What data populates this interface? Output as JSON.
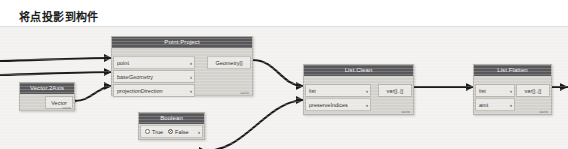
{
  "page": {
    "title": "将点投影到构件"
  },
  "canvas": {
    "background": "#f2f1ef",
    "node_body_color": "#d4d2cd",
    "node_header_color": "#58585a",
    "port_color": "#e9e8e5",
    "wire_color": "#1b1b1b"
  },
  "nodes": [
    {
      "id": "point-project",
      "title": "Point.Project",
      "inputs": [
        {
          "label": "point",
          "chevron": "›"
        },
        {
          "label": "baseGeometry",
          "chevron": "›"
        },
        {
          "label": "projectionDirection",
          "chevron": "›"
        }
      ],
      "outputs": [
        {
          "label": "Geometry[]"
        }
      ],
      "footer": "auto"
    },
    {
      "id": "vector-2axis",
      "title": "Vector.2Axis",
      "inputs": [],
      "outputs": [
        {
          "label": "Vector"
        }
      ],
      "footer": "auto"
    },
    {
      "id": "boolean",
      "title": "Boolean",
      "options": [
        {
          "label": "True",
          "selected": false
        },
        {
          "label": "False",
          "selected": true
        }
      ],
      "chevron": "›",
      "footer": ""
    },
    {
      "id": "list-clean",
      "title": "List.Clean",
      "inputs": [
        {
          "label": "list",
          "chevron": "›"
        },
        {
          "label": "preserveIndices",
          "chevron": "›"
        }
      ],
      "outputs": [
        {
          "label": "var[]..[]"
        }
      ],
      "footer": "auto"
    },
    {
      "id": "list-flatten",
      "title": "List.Flatten",
      "inputs": [
        {
          "label": "list",
          "chevron": "›"
        },
        {
          "label": "amt",
          "chevron": "›"
        }
      ],
      "outputs": [
        {
          "label": "var[]..[]"
        }
      ],
      "footer": "auto"
    }
  ]
}
